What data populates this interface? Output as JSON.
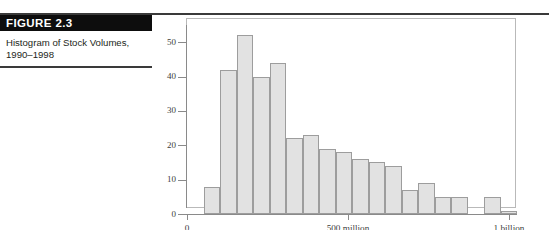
{
  "figure": {
    "banner_label": "FIGURE 2.3",
    "caption": "Histogram of Stock Volumes, 1990–1998"
  },
  "colors": {
    "banner_background": "#0d0d0d",
    "banner_text": "#ffffff",
    "rule": "#3a3a3a",
    "bar_fill": "#e2e2e2",
    "bar_stroke": "#9d9d9d",
    "axis": "#8a8a8a",
    "frame": "#b9b9b9",
    "text": "#231f20"
  },
  "chart_data": {
    "type": "bar",
    "title": "Histogram of Stock Volumes, 1990–1998",
    "xlabel": "",
    "ylabel": "",
    "grid": false,
    "legend": false,
    "ylim": [
      0,
      55
    ],
    "yticks": [
      0,
      10,
      20,
      30,
      40,
      50
    ],
    "ytick_labels": [
      "0",
      "10",
      "20",
      "30",
      "40",
      "50"
    ],
    "xlim": [
      0,
      1025000000
    ],
    "xticks": [
      0,
      500000000,
      1000000000
    ],
    "xtick_labels": [
      "0",
      "500 million",
      "1 billion"
    ],
    "bin_width": 50000000,
    "bin_edges_label_units": "shares",
    "categories": [
      "0–50M",
      "50–100M",
      "100–150M",
      "150–200M",
      "200–250M",
      "250–300M",
      "300–350M",
      "350–400M",
      "400–450M",
      "450–500M",
      "500–550M",
      "550–600M",
      "600–650M",
      "650–700M",
      "700–750M",
      "750–800M",
      "800–850M",
      "850–900M",
      "900–950M",
      "950M–1B"
    ],
    "values": [
      0,
      8,
      42,
      52,
      40,
      44,
      22,
      23,
      19,
      18,
      16,
      15,
      14,
      7,
      9,
      5,
      5,
      0,
      5,
      1
    ],
    "annotations": []
  }
}
